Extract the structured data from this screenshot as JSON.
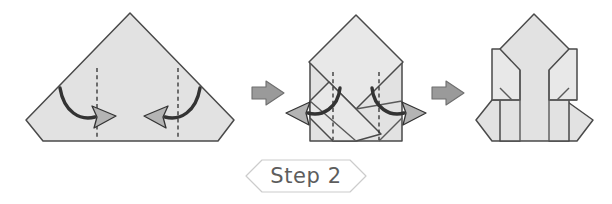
{
  "page": {
    "background_color": "#ffffff",
    "width": 612,
    "height": 204
  },
  "palette": {
    "paper_fill": "#e2e2e2",
    "paper_fill_light": "#e8e8e8",
    "paper_stroke": "#4a4a4a",
    "crease_stroke": "#5a5a5a",
    "fold_dash_stroke": "#2e2e2e",
    "curve_arrow_stroke": "#333333",
    "arrow_head_fill": "#b4b4b4",
    "step_arrow_fill": "#9a9a9a",
    "step_arrow_stroke": "#6e6e6e",
    "banner_stroke": "#cccccc",
    "label_text_color": "#5d5d5d"
  },
  "step_banner": {
    "label": "Step 2",
    "shape": "hexagon-ribbon",
    "center_x": 306,
    "center_y": 176
  },
  "panels": [
    {
      "id": "panel-1",
      "name": "start-shape",
      "description": "Pentagon: triangle with two clipped bottom corners",
      "fold_hint": "Fold both lower side sections inward along the vertical dashed creases",
      "dashed_creases": 2,
      "curved_arrows": [
        {
          "direction": "right",
          "name": "fold-arrow-left"
        },
        {
          "direction": "left",
          "name": "fold-arrow-right"
        }
      ]
    },
    {
      "id": "panel-2",
      "name": "mid-shape",
      "description": "Rectangle base with a rotated square (diamond) overlapping it",
      "fold_hint": "Pull the two lower flaps outward",
      "dashed_creases": 2,
      "curved_arrows": [
        {
          "direction": "left-out",
          "name": "unfold-arrow-left"
        },
        {
          "direction": "right-out",
          "name": "unfold-arrow-right"
        }
      ]
    },
    {
      "id": "panel-3",
      "name": "result-shape",
      "description": "House shaped form with pointed top and two side wing flaps",
      "fold_hint": "",
      "dashed_creases": 0,
      "curved_arrows": []
    }
  ],
  "connectors": [
    {
      "id": "connector-1",
      "name": "step-arrow-1",
      "glyph": "block-arrow-right",
      "x": 265,
      "y": 92
    },
    {
      "id": "connector-2",
      "name": "step-arrow-2",
      "glyph": "block-arrow-right",
      "x": 445,
      "y": 92
    }
  ]
}
